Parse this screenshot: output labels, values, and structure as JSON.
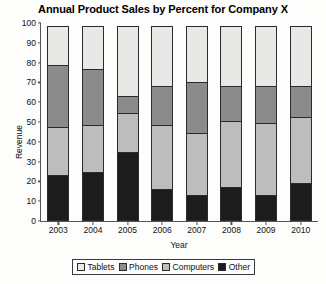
{
  "chart_data": {
    "type": "bar",
    "subtype": "stacked-bar-100-percent",
    "title": "Annual Product Sales by Percent for Company X",
    "xlabel": "Year",
    "ylabel": "Revenue",
    "categories": [
      "2003",
      "2004",
      "2005",
      "2006",
      "2007",
      "2008",
      "2009",
      "2010"
    ],
    "ylim": [
      0,
      100
    ],
    "yticks": [
      0,
      10,
      20,
      30,
      40,
      50,
      60,
      70,
      80,
      90,
      100
    ],
    "ytick_labels": [
      "0",
      "10",
      "20",
      "30",
      "40",
      "50",
      "60",
      "70",
      "80",
      "90",
      "100"
    ],
    "grid": false,
    "legend_position": "bottom",
    "stack_order_bottom_to_top": [
      "Other",
      "Computers",
      "Phones",
      "Tablets"
    ],
    "series": [
      {
        "name": "Tablets",
        "color": "#e8e8e6",
        "values": [
          20,
          22,
          36,
          31,
          29,
          31,
          31,
          31
        ]
      },
      {
        "name": "Phones",
        "color": "#8b8b8b",
        "values": [
          32,
          29,
          9,
          20,
          26,
          18,
          19,
          16
        ]
      },
      {
        "name": "Computers",
        "color": "#bdbdbd",
        "values": [
          25,
          24,
          20,
          33,
          32,
          34,
          37,
          34
        ]
      },
      {
        "name": "Other",
        "color": "#1c1c1c",
        "values": [
          23,
          25,
          35,
          16,
          13,
          17,
          13,
          19
        ]
      }
    ],
    "cumulative_tops": {
      "Other": [
        23,
        25,
        35,
        16,
        13,
        17,
        13,
        19
      ],
      "Computers": [
        48,
        49,
        55,
        49,
        45,
        51,
        50,
        53
      ],
      "Phones": [
        80,
        78,
        64,
        69,
        71,
        69,
        69,
        69
      ],
      "Tablets": [
        100,
        100,
        100,
        100,
        100,
        100,
        100,
        100
      ]
    }
  },
  "legend": {
    "items": [
      {
        "label": "Tablets"
      },
      {
        "label": "Phones"
      },
      {
        "label": "Computers"
      },
      {
        "label": "Other"
      }
    ]
  }
}
